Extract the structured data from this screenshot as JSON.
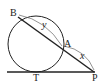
{
  "diagram": {
    "type": "geometry-tangent-secant",
    "points": {
      "B": {
        "label": "B"
      },
      "A": {
        "label": "A"
      },
      "P": {
        "label": "P"
      },
      "T": {
        "label": "T"
      }
    },
    "segment_labels": {
      "BA": "y",
      "AP": "x"
    },
    "colors": {
      "stroke": "#222222",
      "guide": "#555555",
      "background": "#ffffff"
    }
  }
}
